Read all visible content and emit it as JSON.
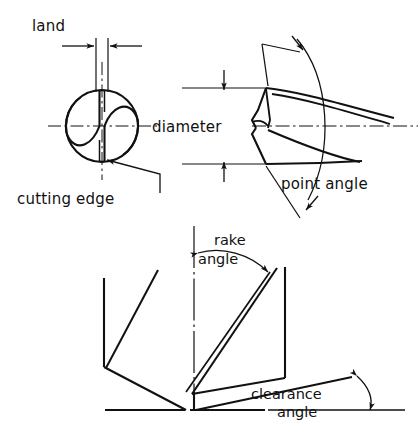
{
  "figure": {
    "background_color": "#ffffff",
    "line_color": "#111111"
  },
  "labels": {
    "land": "land",
    "cutting_edge": "cutting edge",
    "diameter": "diameter",
    "point_angle": "point angle",
    "rake_line1": "rake",
    "rake_line2": "angle",
    "clearance_line1": "clearance",
    "clearance_line2": "angle"
  },
  "views": {
    "end_view": {
      "name": "end-view",
      "description": "Circular end view of two-flute twist drill showing land, flutes and cutting edges"
    },
    "side_view": {
      "name": "side-view",
      "description": "Side view of drill point showing diameter dimension and point angle"
    },
    "section_view": {
      "name": "section-view",
      "description": "Sectional view of drill lip showing rake angle and clearance angle"
    }
  },
  "dimensions": {
    "land": {
      "name": "land-dimension",
      "type": "linear",
      "orientation": "horizontal",
      "arrow_style": "inward"
    },
    "diameter": {
      "name": "diameter-dimension",
      "type": "linear",
      "orientation": "vertical",
      "arrow_style": "inward"
    },
    "point_angle": {
      "name": "point-angle-dimension",
      "type": "angular",
      "arrow_style": "double-ended-arc"
    },
    "rake_angle": {
      "name": "rake-angle-dimension",
      "type": "angular",
      "arrow_style": "double-ended-arc"
    },
    "clearance_angle": {
      "name": "clearance-angle-dimension",
      "type": "angular",
      "arrow_style": "double-ended-arc"
    }
  }
}
